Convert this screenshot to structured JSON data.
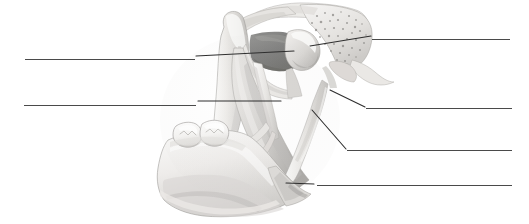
{
  "figure": {
    "style": "grayscale-pencil-illustration",
    "background_color": "#ffffff",
    "line_color": "#4a4a4a",
    "leader_line_color": "#2e2e2e",
    "canvas": {
      "width": 529,
      "height": 224
    }
  },
  "labels": [
    {
      "id": "label-left-upper",
      "side": "left",
      "text": "",
      "blank": {
        "x": 25,
        "y": 59,
        "width": 170
      },
      "leader": {
        "x1": 196,
        "y1": 56,
        "x2": 294,
        "y2": 51
      },
      "points_to": "coronoid-process-notch-shadow"
    },
    {
      "id": "label-left-lower",
      "side": "left",
      "text": "",
      "blank": {
        "x": 24,
        "y": 105,
        "width": 172
      },
      "leader": {
        "x1": 198,
        "y1": 101,
        "x2": 281,
        "y2": 101
      },
      "points_to": "ramus-inner-surface"
    },
    {
      "id": "label-right-upper",
      "side": "right",
      "text": "",
      "blank": {
        "x": 372,
        "y": 39,
        "width": 138
      },
      "leader": {
        "x1": 310,
        "y1": 46,
        "x2": 371,
        "y2": 36
      },
      "points_to": "mandibular-condyle"
    },
    {
      "id": "label-right-second",
      "side": "right",
      "text": "",
      "blank": {
        "x": 366,
        "y": 108,
        "width": 146
      },
      "leader": {
        "x1": 330,
        "y1": 90,
        "x2": 365,
        "y2": 107
      },
      "points_to": "stylomandibular-ligament-upper"
    },
    {
      "id": "label-right-third",
      "side": "right",
      "text": "",
      "blank": {
        "x": 347,
        "y": 150,
        "width": 165
      },
      "leader": {
        "x1": 312,
        "y1": 110,
        "x2": 346,
        "y2": 149
      },
      "points_to": "stylomandibular-ligament-lower"
    },
    {
      "id": "label-right-bottom",
      "side": "right",
      "text": "",
      "blank": {
        "x": 317,
        "y": 185,
        "width": 195
      },
      "leader": {
        "x1": 286,
        "y1": 183,
        "x2": 314,
        "y2": 184
      },
      "points_to": "angle-of-mandible"
    }
  ],
  "illustration_parts": [
    {
      "name": "coronoid-process",
      "description": "Upward pointed process at left of ramus"
    },
    {
      "name": "mandibular-notch",
      "description": "Concave notch between coronoid process and condyle"
    },
    {
      "name": "mandibular-condyle",
      "description": "Rounded head articulating with temporal bone"
    },
    {
      "name": "temporal-bone",
      "description": "Trabecular porous bone region upper right"
    },
    {
      "name": "styloid-process",
      "description": "Slender spine projecting down-right from temporal bone"
    },
    {
      "name": "stylomandibular-ligament",
      "description": "Band running from styloid process to mandibular angle"
    },
    {
      "name": "ramus-of-mandible",
      "description": "Vertical plate of the jaw bone"
    },
    {
      "name": "body-of-mandible",
      "description": "Horizontal portion bearing the teeth"
    },
    {
      "name": "angle-of-mandible",
      "description": "Posterior-inferior corner of the jaw"
    },
    {
      "name": "molar-teeth",
      "description": "Two molar crowns at the left of the body"
    },
    {
      "name": "sphenomandibular-ligament",
      "description": "Thin band crossing inside the ramus"
    },
    {
      "name": "lingula-shadow",
      "description": "Dark shaded rectangular region near the notch"
    }
  ],
  "palette": {
    "bone_light": "#f3f2f0",
    "bone_mid": "#d9d7d4",
    "bone_shadow": "#b4b2af",
    "deep_shadow": "#7d7c7a",
    "dark_patch": "#6e6e6c",
    "tooth_white": "#fafafa",
    "tooth_outline": "#9e9c99",
    "outline": "#8e8c89"
  }
}
